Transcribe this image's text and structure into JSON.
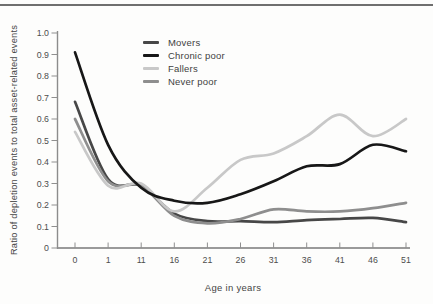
{
  "figure": {
    "background_color": "#fdfdfc",
    "top_rule_color": "#6f6f6f",
    "axis_color": "#9a9a9a",
    "y_axis_color": "#8c8c8c",
    "tick_color": "#8f8f8f",
    "tick_text_color": "#4d4d4d",
    "label_text_color": "#454545"
  },
  "chart_data": {
    "type": "line",
    "title": "",
    "xlabel": "Age in years",
    "ylabel": "Ratio of depletion events to total asset-related events",
    "categories": [
      "0",
      "1",
      "11",
      "16",
      "21",
      "26",
      "31",
      "36",
      "41",
      "46",
      "51"
    ],
    "y_ticks": [
      "0",
      "0.1",
      "0.2",
      "0.3",
      "0.4",
      "0.5",
      "0.6",
      "0.7",
      "0.8",
      "0.9",
      "1.0"
    ],
    "ylim": [
      0,
      1.0
    ],
    "grid": false,
    "legend_position": "inside-top-left",
    "series": [
      {
        "name": "Movers",
        "color": "#474747",
        "values": [
          0.68,
          0.32,
          0.29,
          0.16,
          0.125,
          0.125,
          0.12,
          0.13,
          0.135,
          0.14,
          0.12
        ]
      },
      {
        "name": "Chronic poor",
        "color": "#171717",
        "values": [
          0.91,
          0.48,
          0.28,
          0.22,
          0.21,
          0.25,
          0.31,
          0.38,
          0.39,
          0.48,
          0.45
        ]
      },
      {
        "name": "Fallers",
        "color": "#c8c8c8",
        "values": [
          0.54,
          0.29,
          0.3,
          0.17,
          0.28,
          0.41,
          0.44,
          0.52,
          0.62,
          0.52,
          0.6
        ]
      },
      {
        "name": "Never poor",
        "color": "#8e8e8e",
        "values": [
          0.6,
          0.31,
          0.29,
          0.15,
          0.115,
          0.135,
          0.18,
          0.17,
          0.17,
          0.185,
          0.21
        ]
      }
    ]
  }
}
